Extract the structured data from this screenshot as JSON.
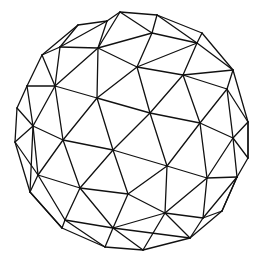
{
  "figure": {
    "width": 260,
    "height": 262,
    "background": "#ffffff",
    "stroke_color": "#111111",
    "stroke_width": 1.3,
    "vertices": {
      "A": [
        120,
        12
      ],
      "B": [
        157,
        15
      ],
      "C": [
        78,
        25
      ],
      "D": [
        107,
        21
      ],
      "E": [
        202,
        33
      ],
      "F": [
        152,
        33
      ],
      "G": [
        197,
        43
      ],
      "H": [
        60,
        47
      ],
      "I": [
        98,
        48
      ],
      "J": [
        42,
        55
      ],
      "K": [
        233,
        70
      ],
      "L": [
        137,
        67
      ],
      "M": [
        183,
        75
      ],
      "N": [
        27,
        86
      ],
      "O": [
        55,
        86
      ],
      "P": [
        227,
        89
      ],
      "Q": [
        97,
        98
      ],
      "R": [
        150,
        113
      ],
      "S": [
        17,
        108
      ],
      "T": [
        248,
        122
      ],
      "U": [
        200,
        123
      ],
      "V": [
        33,
        126
      ],
      "W": [
        15,
        142
      ],
      "X": [
        63,
        140
      ],
      "Y": [
        233,
        138
      ],
      "Z": [
        113,
        150
      ],
      "a": [
        167,
        166
      ],
      "b": [
        248,
        158
      ],
      "c": [
        38,
        175
      ],
      "d": [
        207,
        178
      ],
      "e": [
        237,
        177
      ],
      "f": [
        80,
        188
      ],
      "g": [
        128,
        194
      ],
      "h": [
        30,
        192
      ],
      "i": [
        222,
        211
      ],
      "j": [
        165,
        213
      ],
      "k": [
        203,
        218
      ],
      "l": [
        65,
        220
      ],
      "m": [
        113,
        228
      ],
      "n": [
        62,
        228
      ],
      "o": [
        190,
        238
      ],
      "p": [
        105,
        247
      ],
      "q": [
        143,
        250
      ]
    },
    "edges": [
      [
        "A",
        "B"
      ],
      [
        "A",
        "D"
      ],
      [
        "D",
        "C"
      ],
      [
        "C",
        "J"
      ],
      [
        "J",
        "N"
      ],
      [
        "N",
        "S"
      ],
      [
        "S",
        "W"
      ],
      [
        "W",
        "h"
      ],
      [
        "h",
        "n"
      ],
      [
        "n",
        "p"
      ],
      [
        "p",
        "q"
      ],
      [
        "q",
        "o"
      ],
      [
        "o",
        "i"
      ],
      [
        "i",
        "e"
      ],
      [
        "e",
        "b"
      ],
      [
        "b",
        "T"
      ],
      [
        "T",
        "K"
      ],
      [
        "K",
        "E"
      ],
      [
        "E",
        "B"
      ],
      [
        "C",
        "H"
      ],
      [
        "D",
        "H"
      ],
      [
        "D",
        "I"
      ],
      [
        "A",
        "I"
      ],
      [
        "B",
        "F"
      ],
      [
        "A",
        "F"
      ],
      [
        "F",
        "I"
      ],
      [
        "E",
        "G"
      ],
      [
        "B",
        "G"
      ],
      [
        "F",
        "G"
      ],
      [
        "H",
        "I"
      ],
      [
        "J",
        "H"
      ],
      [
        "J",
        "O"
      ],
      [
        "H",
        "O"
      ],
      [
        "I",
        "O"
      ],
      [
        "I",
        "Q"
      ],
      [
        "I",
        "L"
      ],
      [
        "F",
        "L"
      ],
      [
        "L",
        "G"
      ],
      [
        "G",
        "M"
      ],
      [
        "G",
        "K"
      ],
      [
        "K",
        "M"
      ],
      [
        "K",
        "P"
      ],
      [
        "M",
        "P"
      ],
      [
        "L",
        "M"
      ],
      [
        "L",
        "Q"
      ],
      [
        "L",
        "R"
      ],
      [
        "M",
        "R"
      ],
      [
        "M",
        "U"
      ],
      [
        "P",
        "U"
      ],
      [
        "P",
        "T"
      ],
      [
        "T",
        "Y"
      ],
      [
        "P",
        "Y"
      ],
      [
        "U",
        "Y"
      ],
      [
        "N",
        "O"
      ],
      [
        "N",
        "V"
      ],
      [
        "S",
        "V"
      ],
      [
        "O",
        "V"
      ],
      [
        "O",
        "Q"
      ],
      [
        "V",
        "X"
      ],
      [
        "O",
        "X"
      ],
      [
        "Q",
        "X"
      ],
      [
        "Q",
        "R"
      ],
      [
        "Q",
        "Z"
      ],
      [
        "X",
        "Z"
      ],
      [
        "R",
        "Z"
      ],
      [
        "R",
        "U"
      ],
      [
        "R",
        "a"
      ],
      [
        "U",
        "a"
      ],
      [
        "U",
        "d"
      ],
      [
        "Y",
        "d"
      ],
      [
        "Y",
        "b"
      ],
      [
        "T",
        "b"
      ],
      [
        "Y",
        "e"
      ],
      [
        "d",
        "e"
      ],
      [
        "W",
        "V"
      ],
      [
        "V",
        "h"
      ],
      [
        "W",
        "c"
      ],
      [
        "V",
        "c"
      ],
      [
        "X",
        "c"
      ],
      [
        "X",
        "f"
      ],
      [
        "c",
        "f"
      ],
      [
        "Z",
        "f"
      ],
      [
        "Z",
        "g"
      ],
      [
        "f",
        "g"
      ],
      [
        "Z",
        "a"
      ],
      [
        "a",
        "g"
      ],
      [
        "a",
        "j"
      ],
      [
        "a",
        "d"
      ],
      [
        "d",
        "j"
      ],
      [
        "d",
        "k"
      ],
      [
        "e",
        "k"
      ],
      [
        "e",
        "i"
      ],
      [
        "i",
        "k"
      ],
      [
        "h",
        "c"
      ],
      [
        "c",
        "l"
      ],
      [
        "h",
        "n"
      ],
      [
        "n",
        "l"
      ],
      [
        "f",
        "l"
      ],
      [
        "l",
        "m"
      ],
      [
        "f",
        "m"
      ],
      [
        "g",
        "m"
      ],
      [
        "g",
        "j"
      ],
      [
        "j",
        "m"
      ],
      [
        "j",
        "k"
      ],
      [
        "j",
        "o"
      ],
      [
        "k",
        "o"
      ],
      [
        "l",
        "p"
      ],
      [
        "m",
        "p"
      ],
      [
        "m",
        "q"
      ],
      [
        "m",
        "o"
      ],
      [
        "j",
        "q"
      ]
    ]
  }
}
